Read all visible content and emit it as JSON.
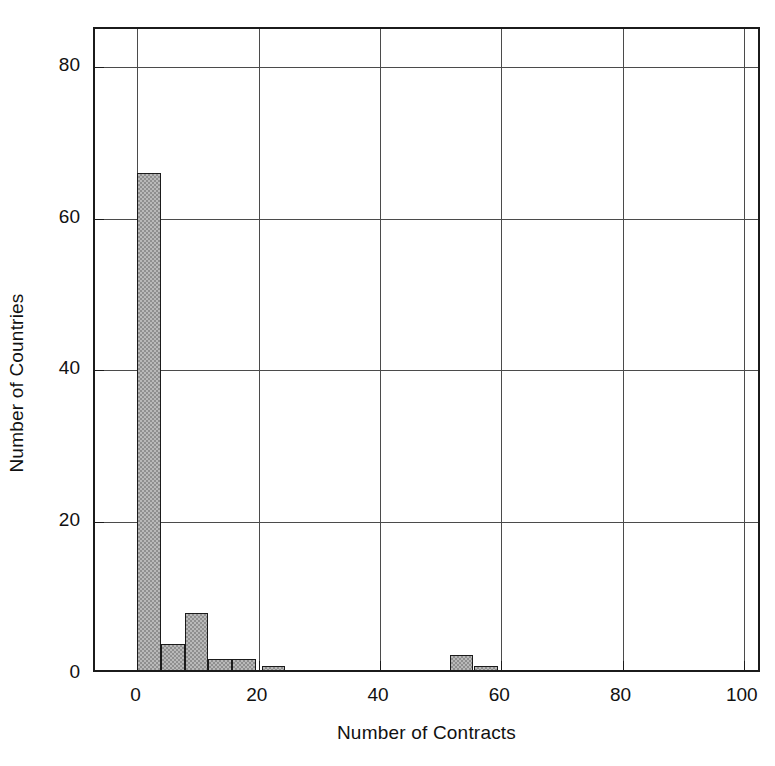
{
  "chart_data": {
    "type": "bar",
    "title": "",
    "subtitle": "",
    "xlabel": "Number of Contracts",
    "ylabel": "Number of Countries",
    "xlim": [
      -7,
      103
    ],
    "ylim": [
      0,
      85
    ],
    "xticks": [
      0,
      20,
      40,
      60,
      80,
      100
    ],
    "yticks": [
      0,
      20,
      40,
      60,
      80
    ],
    "xtick_labels": [
      "0",
      "20",
      "40",
      "60",
      "80",
      "100"
    ],
    "ytick_labels": [
      "0",
      "20",
      "40",
      "60",
      "80"
    ],
    "grid": true,
    "legend": null,
    "bin_width": 3.9,
    "bar_fill": "#b9b9b9",
    "bar_pattern": "#8f8f8f",
    "bar_edge": "#1b1b1b",
    "axis_color": "#1b1b1b",
    "grid_color": "#4b4b4b",
    "background": "#ffffff",
    "bins": [
      {
        "x_start": 0.0,
        "x_end": 3.9,
        "center": 1.95,
        "value": 66
      },
      {
        "x_start": 3.9,
        "x_end": 7.8,
        "center": 5.85,
        "value": 4
      },
      {
        "x_start": 7.8,
        "x_end": 11.7,
        "center": 9.75,
        "value": 8
      },
      {
        "x_start": 11.7,
        "x_end": 15.6,
        "center": 13.65,
        "value": 2
      },
      {
        "x_start": 15.6,
        "x_end": 19.5,
        "center": 17.55,
        "value": 2
      },
      {
        "x_start": 20.5,
        "x_end": 24.4,
        "center": 22.45,
        "value": 1
      },
      {
        "x_start": 51.5,
        "x_end": 55.4,
        "center": 53.45,
        "value": 2.5
      },
      {
        "x_start": 55.5,
        "x_end": 59.4,
        "center": 57.45,
        "value": 1
      }
    ],
    "categories": [
      "0-3.9",
      "3.9-7.8",
      "7.8-11.7",
      "11.7-15.6",
      "15.6-19.5",
      "20.5-24.4",
      "51.5-55.4",
      "55.5-59.4"
    ],
    "values": [
      66,
      4,
      8,
      2,
      2,
      1,
      2.5,
      1
    ]
  }
}
